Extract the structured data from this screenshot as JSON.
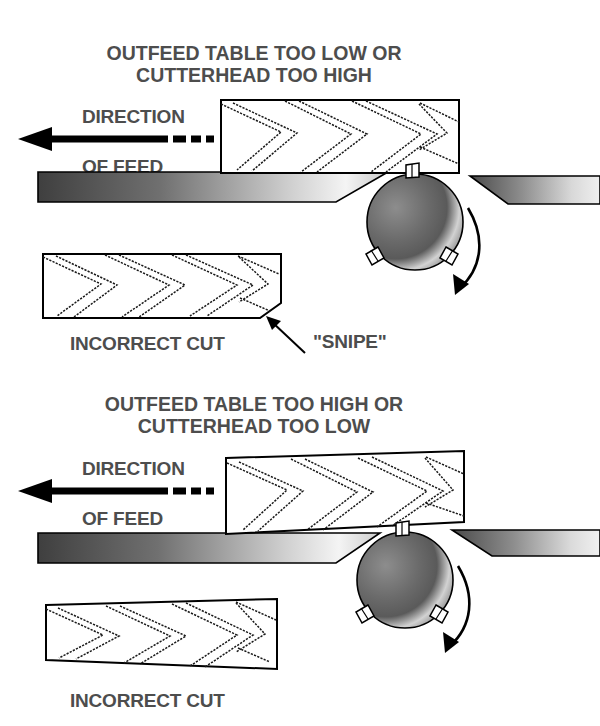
{
  "page": {
    "background_color": "#ffffff",
    "text_color": "#4d4d4d",
    "line_color": "#000000"
  },
  "diagrams": [
    {
      "id": "outfeed-too-low",
      "title_line_1": "OUTFEED TABLE TOO LOW OR",
      "title_line_2": "CUTTERHEAD TOO  HIGH",
      "direction_label_line_1": "DIRECTION",
      "direction_label_line_2": "OF FEED",
      "result_label": "INCORRECT CUT",
      "defect_label": "\"SNIPE\"",
      "feed_arrow_direction": "left",
      "cutterhead_rotation": "clockwise",
      "cutterhead_blade_count": 3,
      "infeed_table_position": "left",
      "outfeed_table_position": "right",
      "outfeed_table_state": "lower than infeed table",
      "board_profile": "rectangular board with sniped (beveled) trailing bottom corner",
      "grain_pattern": "chevron"
    },
    {
      "id": "outfeed-too-high",
      "title_line_1": "OUTFEED TABLE TOO HIGH OR",
      "title_line_2": "CUTTERHEAD  TOO LOW",
      "direction_label_line_1": "DIRECTION",
      "direction_label_line_2": "OF FEED",
      "result_label": "INCORRECT CUT",
      "feed_arrow_direction": "left",
      "cutterhead_rotation": "clockwise",
      "cutterhead_blade_count": 3,
      "infeed_table_position": "left",
      "outfeed_table_position": "right",
      "outfeed_table_state": "higher than infeed table",
      "board_profile": "tapered board, thicker at trailing end",
      "grain_pattern": "chevron"
    }
  ],
  "colors": {
    "table_gradient_dark": "#4a4a4a",
    "table_gradient_light": "#e8e8e8",
    "cutterhead_dark": "#555555",
    "cutterhead_light": "#f2f2f2",
    "outline": "#000000",
    "text": "#4d4d4d"
  }
}
